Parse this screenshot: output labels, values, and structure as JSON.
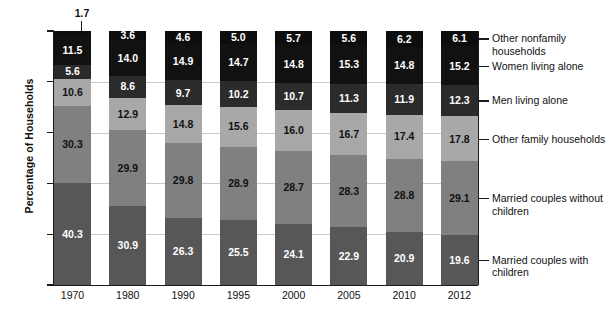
{
  "axes": {
    "ylabel": "Percentage of Households",
    "yticks": [
      "0",
      "20",
      "40",
      "60",
      "80",
      "100"
    ],
    "ylim": [
      0,
      100
    ],
    "xticks": [
      "1970",
      "1980",
      "1990",
      "1995",
      "2000",
      "2005",
      "2010",
      "2012"
    ]
  },
  "callout": {
    "value": "1.7",
    "note": "Other nonfamily households 1970"
  },
  "legend": [
    {
      "label": "Other nonfamily households",
      "color": "#0d0d0d"
    },
    {
      "label": "Women living alone",
      "color": "#111111"
    },
    {
      "label": "Men living alone",
      "color": "#2b2b2b"
    },
    {
      "label": "Other family households",
      "color": "#a8a8a8"
    },
    {
      "label": "Married couples without children",
      "color": "#808080"
    },
    {
      "label": "Married couples with children",
      "color": "#575757"
    }
  ],
  "colors": {
    "other_nonfamily": "#0d0d0d",
    "women_alone": "#111111",
    "men_alone": "#2b2b2b",
    "other_family": "#a8a8a8",
    "married_no_children": "#808080",
    "married_with_children": "#575757",
    "gridline": "#c9c9c9",
    "axis": "#1a1a1a",
    "background": "#ffffff",
    "label_dark": "#111111",
    "label_light": "#ffffff"
  },
  "chart_data": {
    "type": "bar",
    "subtype": "stacked-bar-100",
    "title": "",
    "xlabel": "",
    "ylabel": "Percentage of Households",
    "ylim": [
      0,
      100
    ],
    "grid": true,
    "legend_position": "right",
    "categories": [
      "1970",
      "1980",
      "1990",
      "1995",
      "2000",
      "2005",
      "2010",
      "2012"
    ],
    "stack_order_bottom_to_top": [
      "Married couples with children",
      "Married couples without children",
      "Other family households",
      "Men living alone",
      "Women living alone",
      "Other nonfamily households"
    ],
    "series": [
      {
        "name": "Married couples with children",
        "color": "#575757",
        "label_color": "#ffffff",
        "values": [
          40.3,
          30.9,
          26.3,
          25.5,
          24.1,
          22.9,
          20.9,
          19.6
        ]
      },
      {
        "name": "Married couples without children",
        "color": "#808080",
        "label_color": "#111111",
        "values": [
          30.3,
          29.9,
          29.8,
          28.9,
          28.7,
          28.3,
          28.8,
          29.1
        ]
      },
      {
        "name": "Other family households",
        "color": "#a8a8a8",
        "label_color": "#111111",
        "values": [
          10.6,
          12.9,
          14.8,
          15.6,
          16.0,
          16.7,
          17.4,
          17.8
        ]
      },
      {
        "name": "Men living alone",
        "color": "#2b2b2b",
        "label_color": "#ffffff",
        "values": [
          5.6,
          8.6,
          9.7,
          10.2,
          10.7,
          11.3,
          11.9,
          12.3
        ]
      },
      {
        "name": "Women living alone",
        "color": "#111111",
        "label_color": "#ffffff",
        "values": [
          11.5,
          14.0,
          14.9,
          14.7,
          14.8,
          15.3,
          14.8,
          15.2
        ]
      },
      {
        "name": "Other nonfamily households",
        "color": "#0d0d0d",
        "label_color": "#ffffff",
        "values": [
          1.7,
          3.6,
          4.6,
          5.0,
          5.7,
          5.6,
          6.2,
          6.1
        ],
        "label_outside_index": 0
      }
    ]
  }
}
